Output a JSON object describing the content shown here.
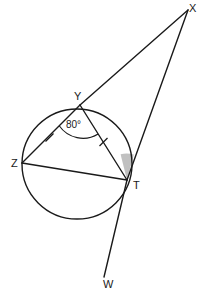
{
  "figure": {
    "background_color": "#ffffff",
    "stroke_color": "#1a1a1a",
    "shade_color": "#bdbdbd"
  },
  "points": {
    "X": {
      "label": "X",
      "x": 188,
      "y": 10,
      "label_x": 189,
      "label_y": 12
    },
    "Y": {
      "label": "Y",
      "x": 80,
      "y": 105,
      "label_x": 74,
      "label_y": 100
    },
    "Z": {
      "label": "Z",
      "x": 22,
      "y": 163,
      "label_x": 11,
      "label_y": 167
    },
    "T": {
      "label": "T",
      "x": 127,
      "y": 180,
      "label_x": 133,
      "label_y": 189
    },
    "W": {
      "label": "W",
      "x": 104,
      "y": 277,
      "label_x": 103,
      "label_y": 288
    }
  },
  "circle": {
    "center_x": 77,
    "center_y": 164,
    "radius": 55
  },
  "segments": [
    {
      "name": "segment-XY",
      "from": "X",
      "to": "Y"
    },
    {
      "name": "segment-YZ",
      "from": "Y",
      "to": "Z",
      "tick": 1
    },
    {
      "name": "segment-YT",
      "from": "Y",
      "to": "T",
      "tick": 1
    },
    {
      "name": "segment-ZT",
      "from": "Z",
      "to": "T"
    },
    {
      "name": "segment-XT",
      "from": "X",
      "to": "T"
    },
    {
      "name": "segment-TW",
      "from": "T",
      "to": "W"
    }
  ],
  "angles": {
    "at_Y": {
      "label": "80°",
      "value": 80,
      "unit": "degrees",
      "label_x": 66,
      "label_y": 128
    },
    "at_T": {
      "label": "",
      "shaded": true,
      "fill": "#bdbdbd"
    }
  },
  "tick_marks": {
    "count": 2,
    "note": "congruent chords YZ and YT"
  }
}
